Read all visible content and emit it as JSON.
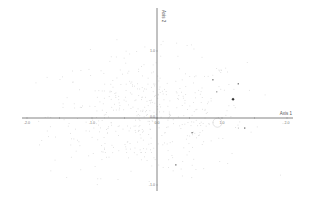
{
  "chart_data": {
    "type": "scatter",
    "title": "",
    "xlabel": "Axis 1",
    "ylabel": "Axis 2",
    "xlim": [
      -2.1,
      2.1
    ],
    "ylim": [
      -1.05,
      1.6
    ],
    "grid": false,
    "legend": null,
    "x_ticks": [
      {
        "value": -2.0,
        "label": "-2.0"
      },
      {
        "value": -1.5,
        "label": ""
      },
      {
        "value": -1.0,
        "label": "-1.0"
      },
      {
        "value": -0.5,
        "label": ""
      },
      {
        "value": 0.0,
        "label": "0.0"
      },
      {
        "value": 0.5,
        "label": ""
      },
      {
        "value": 1.0,
        "label": "1.0"
      },
      {
        "value": 1.5,
        "label": ""
      },
      {
        "value": 2.0,
        "label": "2.0"
      }
    ],
    "y_ticks": [
      {
        "value": 1.0,
        "label": "1.0"
      },
      {
        "value": 0.0,
        "label": "0.0"
      },
      {
        "value": -1.0,
        "label": "-1.0"
      }
    ],
    "series": [
      {
        "name": "highlighted",
        "color": "#333333",
        "points": [
          {
            "x": 0.86,
            "y": 0.57,
            "size": 2.2
          },
          {
            "x": 1.25,
            "y": 0.51,
            "size": 2.2
          },
          {
            "x": 0.92,
            "y": 0.39,
            "size": 1.8
          },
          {
            "x": 1.17,
            "y": 0.28,
            "size": 3.2,
            "shape": "diamond"
          },
          {
            "x": 1.35,
            "y": -0.15,
            "size": 2.2
          },
          {
            "x": 1.25,
            "y": -0.15,
            "size": 1.2
          },
          {
            "x": 0.54,
            "y": -0.22,
            "size": 2.2
          },
          {
            "x": 0.29,
            "y": -0.7,
            "size": 2.2
          }
        ]
      },
      {
        "name": "background",
        "color": "#dcdcdc",
        "point_count": 500,
        "distribution": "roughly elliptical cloud centered near (-0.2, 0.05), spread x ±1.8, y ±1.0"
      }
    ],
    "annotations": [
      {
        "type": "circle",
        "x": 0.93,
        "y": -0.07,
        "r": 0.07,
        "color": "#c8c8c8"
      }
    ]
  },
  "axes": {
    "x_axis_label": "Axis 1",
    "y_axis_label": "Axis 2"
  }
}
